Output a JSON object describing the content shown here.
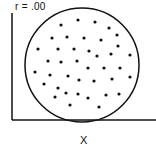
{
  "chart_data": {
    "type": "scatter",
    "title": "r = .00",
    "xlabel": "X",
    "ylabel": "",
    "grid": false,
    "legend": null,
    "annotation": "circular envelope around points indicating zero correlation",
    "envelope": {
      "shape": "circle",
      "cx": 82,
      "cy": 65,
      "r": 57
    },
    "points": [
      {
        "x": 61,
        "y": 25
      },
      {
        "x": 78,
        "y": 20
      },
      {
        "x": 95,
        "y": 22
      },
      {
        "x": 109,
        "y": 28
      },
      {
        "x": 52,
        "y": 38
      },
      {
        "x": 67,
        "y": 37
      },
      {
        "x": 84,
        "y": 38
      },
      {
        "x": 101,
        "y": 40
      },
      {
        "x": 117,
        "y": 35
      },
      {
        "x": 38,
        "y": 49
      },
      {
        "x": 58,
        "y": 49
      },
      {
        "x": 74,
        "y": 49
      },
      {
        "x": 89,
        "y": 51
      },
      {
        "x": 118,
        "y": 46
      },
      {
        "x": 97,
        "y": 56
      },
      {
        "x": 111,
        "y": 54
      },
      {
        "x": 130,
        "y": 55
      },
      {
        "x": 48,
        "y": 61
      },
      {
        "x": 61,
        "y": 62
      },
      {
        "x": 77,
        "y": 61
      },
      {
        "x": 35,
        "y": 72
      },
      {
        "x": 88,
        "y": 68
      },
      {
        "x": 104,
        "y": 68
      },
      {
        "x": 120,
        "y": 68
      },
      {
        "x": 50,
        "y": 75
      },
      {
        "x": 68,
        "y": 76
      },
      {
        "x": 79,
        "y": 80
      },
      {
        "x": 94,
        "y": 81
      },
      {
        "x": 112,
        "y": 79
      },
      {
        "x": 130,
        "y": 77
      },
      {
        "x": 44,
        "y": 84
      },
      {
        "x": 58,
        "y": 88
      },
      {
        "x": 66,
        "y": 93
      },
      {
        "x": 78,
        "y": 94
      },
      {
        "x": 88,
        "y": 98
      },
      {
        "x": 55,
        "y": 97
      },
      {
        "x": 106,
        "y": 95
      },
      {
        "x": 119,
        "y": 94
      },
      {
        "x": 70,
        "y": 105
      },
      {
        "x": 99,
        "y": 107
      }
    ],
    "point_units": "pixel coordinates (no numeric axis ticks shown)"
  },
  "colors": {
    "ink": "#111111",
    "background": "#ffffff"
  }
}
